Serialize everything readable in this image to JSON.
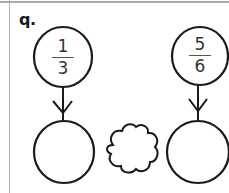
{
  "problem": {
    "label": "q.",
    "fraction_left": {
      "numerator": "1",
      "denominator": "3"
    },
    "fraction_right": {
      "numerator": "5",
      "denominator": "6"
    },
    "answer_left": "",
    "answer_right": "",
    "comparison_symbol": ""
  },
  "colors": {
    "stroke": "#1a1a1a",
    "rule": "#a8a8a8",
    "text": "#333333"
  }
}
